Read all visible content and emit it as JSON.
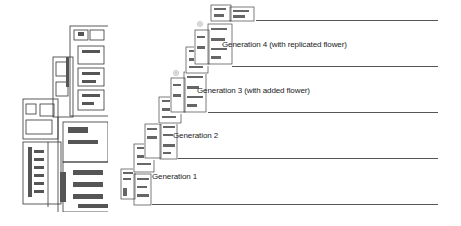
{
  "figure": {
    "left_panel": {
      "name": "full-circuit-layout"
    },
    "generations": [
      {
        "label": "Generation 1",
        "line_y": 204,
        "label_x": 152,
        "label_y": 172
      },
      {
        "label": "Generation 2",
        "line_y": 158,
        "label_x": 173,
        "label_y": 131
      },
      {
        "label": "Generation 3 (with added flower)",
        "line_y": 112,
        "label_x": 197,
        "label_y": 86
      },
      {
        "label": "Generation 4 (with replicated flower)",
        "line_y": 66,
        "label_x": 222,
        "label_y": 40
      }
    ],
    "top_line_y": 20,
    "line_end_x": 438,
    "colors": {
      "ink": "#222222",
      "line": "#555555",
      "mid": "#888888",
      "light": "#bbbbbb"
    }
  }
}
